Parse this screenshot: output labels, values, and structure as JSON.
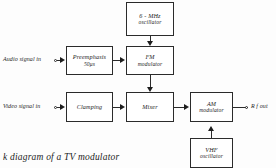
{
  "diagram": {
    "caption": "k diagram of a TV modulator",
    "blocks": [
      {
        "id": "six-mhz-oscillator",
        "line1": "6 - MHz",
        "line2": "oscillator"
      },
      {
        "id": "preemphasis",
        "line1": "Preemphasis",
        "line2": "50μs"
      },
      {
        "id": "fm-modulator",
        "line1": "FM",
        "line2": "modulator"
      },
      {
        "id": "clamping",
        "line1": "Clamping",
        "line2": ""
      },
      {
        "id": "mixer",
        "line1": "Mixer",
        "line2": ""
      },
      {
        "id": "am-modulator",
        "line1": "AM",
        "line2": "modulator"
      },
      {
        "id": "vhf-oscillator",
        "line1": "VHF",
        "line2": "oscillator"
      }
    ],
    "io_labels": {
      "audio_in": "Audio signal in",
      "video_in": "Video signal  in",
      "rf_out": "R f out"
    },
    "colors": {
      "line": "#2b2b2b",
      "text": "#1d1d1d",
      "background": "#fdfdfd",
      "block_fill": "#ffffff"
    }
  }
}
